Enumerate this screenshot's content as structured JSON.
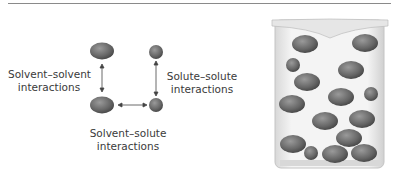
{
  "diagram": {
    "labels": {
      "solvent_solvent": [
        "Solvent–solvent",
        "interactions"
      ],
      "solute_solute": [
        "Solute–solute",
        "interactions"
      ],
      "solvent_solute": [
        "Solvent–solute",
        "interactions"
      ]
    },
    "particles": {
      "solvent_color": "#6e6e6e",
      "solute_color": "#6e6e6e"
    },
    "beaker": {
      "glass_color": "#e8e8e8",
      "particle_count": 16
    }
  }
}
